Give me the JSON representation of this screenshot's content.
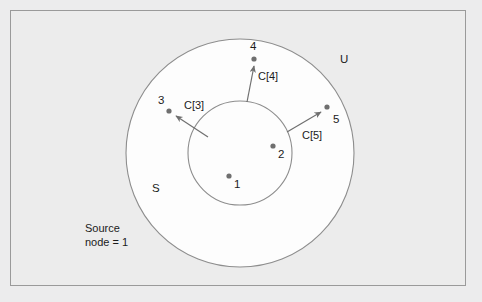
{
  "figure": {
    "background_color": "#ececec",
    "frame_color": "#9a9a9a",
    "circle_fill": "#fdfdfd",
    "circle_stroke": "#8d8d8d",
    "node_color": "#6f6f6f",
    "arrow_color": "#6f6f6f",
    "text_color": "#1b1b1b"
  },
  "sets": {
    "inner": {
      "label": "S",
      "cx": 240,
      "cy": 153,
      "r": 52
    },
    "outer": {
      "label": "U",
      "cx": 240,
      "cy": 153,
      "r": 114
    }
  },
  "labels": {
    "set_s": "S",
    "set_u": "U",
    "source_line1": "Source",
    "source_line2": "node = 1"
  },
  "nodes": [
    {
      "id": "1",
      "label": "1",
      "x": 229,
      "y": 176,
      "label_x": 234,
      "label_y": 178,
      "region": "inner"
    },
    {
      "id": "2",
      "label": "2",
      "x": 273,
      "y": 146,
      "label_x": 278,
      "label_y": 148,
      "region": "inner"
    },
    {
      "id": "3",
      "label": "3",
      "x": 169,
      "y": 111,
      "label_x": 158,
      "label_y": 94,
      "region": "outer"
    },
    {
      "id": "4",
      "label": "4",
      "x": 254,
      "y": 59,
      "label_x": 250,
      "label_y": 40,
      "region": "outer"
    },
    {
      "id": "5",
      "label": "5",
      "x": 327,
      "y": 107,
      "label_x": 333,
      "label_y": 113,
      "region": "outer"
    }
  ],
  "edges": [
    {
      "label": "C[3]",
      "target": "3",
      "x1": 208,
      "y1": 137,
      "x2": 176,
      "y2": 116,
      "label_x": 184,
      "label_y": 99
    },
    {
      "label": "C[4]",
      "target": "4",
      "x1": 247,
      "y1": 102,
      "x2": 254,
      "y2": 66,
      "label_x": 258,
      "label_y": 70
    },
    {
      "label": "C[5]",
      "target": "5",
      "x1": 287,
      "y1": 132,
      "x2": 321,
      "y2": 112,
      "label_x": 302,
      "label_y": 129
    }
  ]
}
